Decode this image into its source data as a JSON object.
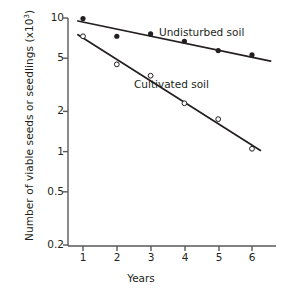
{
  "chart_data": {
    "type": "scatter",
    "title": "",
    "xlabel": "Years",
    "ylabel": "Number of viable seeds or seedlings (x10³)",
    "ylabel_main": "Number of viable seeds or seedlings (x10",
    "ylabel_sup": "3",
    "ylabel_tail": ")",
    "yscale": "log",
    "ylim": [
      0.2,
      10
    ],
    "xlim": [
      0.5,
      6.7
    ],
    "grid": false,
    "legend_position": "inline-annotations",
    "x_ticks": [
      1,
      2,
      3,
      4,
      5,
      6
    ],
    "x_tick_labels": [
      "1",
      "2",
      "3",
      "4",
      "5",
      "6"
    ],
    "y_ticks": [
      0.2,
      0.5,
      1,
      2,
      5,
      10
    ],
    "y_tick_labels": [
      "0.2",
      "0.5",
      "1",
      "2",
      "5",
      "10"
    ],
    "x": [
      1,
      2,
      3,
      4,
      5,
      6
    ],
    "series": [
      {
        "name": "Undisturbed soil",
        "marker": "filled-circle",
        "values": [
          9.9,
          7.3,
          7.6,
          6.7,
          5.7,
          5.3
        ],
        "fit_line": {
          "x_start": 0.85,
          "y_start": 9.5,
          "x_end": 6.55,
          "y_end": 4.75
        }
      },
      {
        "name": "Cultivated soil",
        "marker": "open-circle",
        "values": [
          7.3,
          4.5,
          3.7,
          2.3,
          1.75,
          1.05
        ],
        "fit_line": {
          "x_start": 0.85,
          "y_start": 7.5,
          "x_end": 6.25,
          "y_end": 1.02
        }
      }
    ],
    "annotations": [
      {
        "text": "Undisturbed soil",
        "x_px": 159,
        "y_px": 26
      },
      {
        "text": "Cultivated soil",
        "x_px": 134,
        "y_px": 78
      }
    ],
    "colors": {
      "axis": "#58595b",
      "line": "#231f20",
      "marker_filled": "#231f20",
      "marker_open_stroke": "#231f20",
      "text": "#231f20",
      "background": "#ffffff"
    }
  }
}
